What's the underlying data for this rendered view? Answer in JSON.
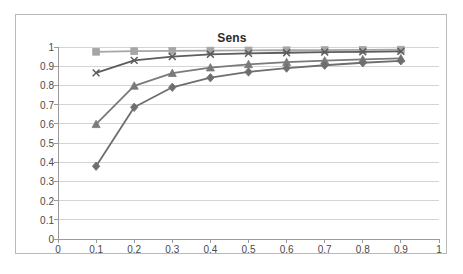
{
  "chart_data": {
    "type": "line",
    "title": "Sens",
    "xlabel": "",
    "ylabel": "",
    "xlim": [
      0,
      1
    ],
    "ylim": [
      0,
      1
    ],
    "x": [
      0.1,
      0.2,
      0.3,
      0.4,
      0.5,
      0.6,
      0.7,
      0.8,
      0.9
    ],
    "xticks": [
      "0",
      "0.1",
      "0.2",
      "0.3",
      "0.4",
      "0.5",
      "0.6",
      "0.7",
      "0.8",
      "0.9",
      "1"
    ],
    "yticks": [
      "0",
      "0.1",
      "0.2",
      "0.3",
      "0.4",
      "0.5",
      "0.6",
      "0.7",
      "0.8",
      "0.9",
      "1"
    ],
    "grid": "horizontal",
    "legend": "none",
    "series": [
      {
        "name": "series-1-square",
        "marker": "square",
        "color": "#a6a6a6",
        "values": [
          0.975,
          0.978,
          0.98,
          0.981,
          0.982,
          0.983,
          0.984,
          0.985,
          0.986
        ]
      },
      {
        "name": "series-2-cross",
        "marker": "x",
        "color": "#5c5c5c",
        "values": [
          0.865,
          0.93,
          0.95,
          0.962,
          0.967,
          0.97,
          0.973,
          0.975,
          0.977
        ]
      },
      {
        "name": "series-3-triangle",
        "marker": "triangle",
        "color": "#7a7a7a",
        "values": [
          0.598,
          0.798,
          0.864,
          0.893,
          0.91,
          0.921,
          0.929,
          0.936,
          0.941
        ]
      },
      {
        "name": "series-4-diamond",
        "marker": "diamond",
        "color": "#6e6e6e",
        "values": [
          0.379,
          0.686,
          0.79,
          0.84,
          0.87,
          0.89,
          0.905,
          0.918,
          0.928
        ]
      }
    ]
  },
  "axis": {
    "gridline_color": "#d4d4d4",
    "axis_color": "#9a9a9a",
    "tick_text_color": "#4a4a4a"
  }
}
